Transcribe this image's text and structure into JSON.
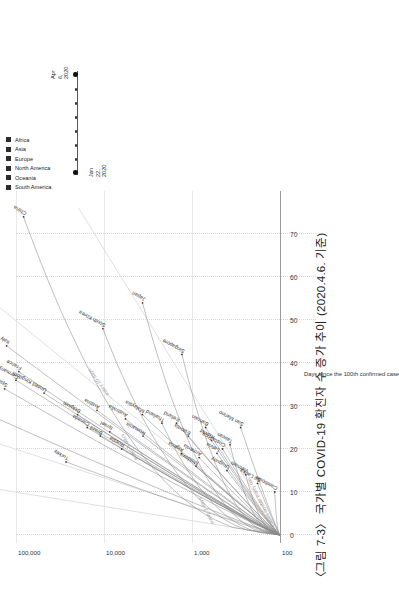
{
  "figure": {
    "title": "〈그림 7-3〉 국가별 COVID-19 확진자 수 증가 추이 (2020.4.6. 기준)",
    "rotation_degrees": 90
  },
  "legend": {
    "continents": [
      {
        "label": "Africa",
        "color": "#2b2b2b"
      },
      {
        "label": "Asia",
        "color": "#2b2b2b"
      },
      {
        "label": "Europe",
        "color": "#2b2b2b"
      },
      {
        "label": "North America",
        "color": "#2b2b2b"
      },
      {
        "label": "Oceania",
        "color": "#2b2b2b"
      },
      {
        "label": "South America",
        "color": "#2b2b2b"
      }
    ],
    "date_scale": {
      "start_line1": "Jan",
      "start_line2": "22,",
      "start_line3": "2020",
      "end_line1": "Apr",
      "end_line2": "6,",
      "end_line3": "2020"
    }
  },
  "chart_data": {
    "type": "line",
    "title": "〈그림 7-3〉 국가별 COVID-19 확진자 수 증가 추이 (2020.4.6. 기준)",
    "xlabel": "Days since the 100th confirmed case",
    "ylabel": "",
    "yscale": "log",
    "xlim": [
      0,
      76
    ],
    "ylim": [
      100,
      400000
    ],
    "grid": true,
    "legend_position": "top-right",
    "xticks": [
      "0",
      "10",
      "20",
      "30",
      "40",
      "50",
      "60",
      "70"
    ],
    "xtick_values": [
      0,
      10,
      20,
      30,
      40,
      50,
      60,
      70
    ],
    "yticks": [
      "100",
      "1,000",
      "10,000",
      "100,000"
    ],
    "ytick_values": [
      100,
      1000,
      10000,
      100000
    ],
    "annotations": [
      {
        "text": "Cases double every day",
        "doubling_days": 1
      },
      {
        "text": "... every 2 days",
        "doubling_days": 2
      },
      {
        "text": "... every 5 days",
        "doubling_days": 5
      },
      {
        "text": "... every 10 days",
        "doubling_days": 10
      }
    ],
    "series": [
      {
        "name": "China",
        "continent": "Asia",
        "days": 74,
        "final": 82000
      },
      {
        "name": "United States",
        "continent": "North America",
        "days": 30,
        "final": 337000
      },
      {
        "name": "Spain",
        "continent": "Europe",
        "days": 34,
        "final": 135000
      },
      {
        "name": "Italy",
        "continent": "Europe",
        "days": 44,
        "final": 128000
      },
      {
        "name": "Germany",
        "continent": "Europe",
        "days": 36,
        "final": 100000
      },
      {
        "name": "France",
        "continent": "Europe",
        "days": 38,
        "final": 93000
      },
      {
        "name": "United Kingdom",
        "continent": "Europe",
        "days": 33,
        "final": 48000
      },
      {
        "name": "Belgium",
        "continent": "Europe",
        "days": 28,
        "final": 20000
      },
      {
        "name": "Canada",
        "continent": "North America",
        "days": 25,
        "final": 15500
      },
      {
        "name": "Austria",
        "continent": "Europe",
        "days": 29,
        "final": 12000
      },
      {
        "name": "Brazil",
        "continent": "South America",
        "days": 23,
        "final": 11000
      },
      {
        "name": "Israel",
        "continent": "Asia",
        "days": 24,
        "final": 8600
      },
      {
        "name": "Turkey",
        "continent": "Asia",
        "days": 17,
        "final": 27000
      },
      {
        "name": "South Korea",
        "continent": "Asia",
        "days": 48,
        "final": 10300
      },
      {
        "name": "Japan",
        "continent": "Asia",
        "days": 54,
        "final": 3650
      },
      {
        "name": "Singapore",
        "continent": "Asia",
        "days": 42,
        "final": 1300
      },
      {
        "name": "Australia",
        "continent": "Oceania",
        "days": 27,
        "final": 5700
      },
      {
        "name": "Malaysia",
        "continent": "Asia",
        "days": 28,
        "final": 3660
      },
      {
        "name": "Russia",
        "continent": "Europe",
        "days": 20,
        "final": 6300
      },
      {
        "name": "Romania",
        "continent": "Europe",
        "days": 23,
        "final": 3600
      },
      {
        "name": "Thailand",
        "continent": "Asia",
        "days": 26,
        "final": 2200
      },
      {
        "name": "Iceland",
        "continent": "Europe",
        "days": 26,
        "final": 1500
      },
      {
        "name": "Estonia",
        "continent": "Europe",
        "days": 23,
        "final": 1100
      },
      {
        "name": "Costa Rica",
        "continent": "North America",
        "days": 20,
        "final": 450
      },
      {
        "name": "Algeria",
        "continent": "Africa",
        "days": 19,
        "final": 1320
      },
      {
        "name": "Moldova",
        "continent": "Europe",
        "days": 16,
        "final": 900
      },
      {
        "name": "Armenia",
        "continent": "Asia",
        "days": 18,
        "final": 830
      },
      {
        "name": "Latvia",
        "continent": "Europe",
        "days": 19,
        "final": 520
      },
      {
        "name": "Bahrain",
        "continent": "Asia",
        "days": 25,
        "final": 700
      },
      {
        "name": "Kuwait",
        "continent": "Asia",
        "days": 22,
        "final": 600
      },
      {
        "name": "Taiwan",
        "continent": "Asia",
        "days": 21,
        "final": 370
      },
      {
        "name": "San Marino",
        "continent": "Europe",
        "days": 25,
        "final": 280
      },
      {
        "name": "Vietnam",
        "continent": "Asia",
        "days": 14,
        "final": 245
      },
      {
        "name": "Sri Lanka",
        "continent": "Asia",
        "days": 12,
        "final": 180
      },
      {
        "name": "Cambodia",
        "continent": "Asia",
        "days": 10,
        "final": 115
      },
      {
        "name": "Uruguay",
        "continent": "South America",
        "days": 15,
        "final": 400
      }
    ]
  },
  "country_labels": [
    "China",
    "United States",
    "Spain",
    "Italy",
    "Germany",
    "France",
    "United Kingdom",
    "Belgium",
    "Canada",
    "Austria",
    "Brazil",
    "Israel",
    "Turkey",
    "South Korea",
    "Japan",
    "Singapore",
    "Australia",
    "Malaysia",
    "Russia",
    "Romania",
    "Thailand",
    "Iceland",
    "Estonia",
    "Costa Rica",
    "Algeria",
    "Moldova",
    "Armenia",
    "Latvia",
    "Bahrain",
    "Kuwait",
    "Taiwan",
    "San Marino",
    "Vietnam",
    "Sri Lanka",
    "Cambodia",
    "Uruguay"
  ]
}
